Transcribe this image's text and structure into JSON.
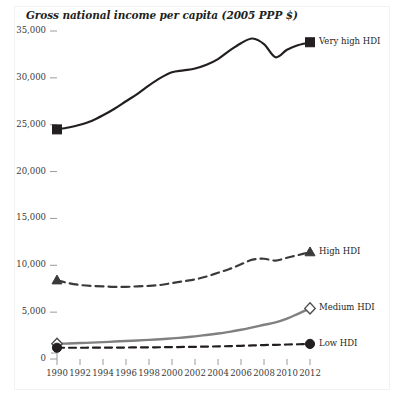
{
  "chart_data": {
    "type": "line",
    "title": "Gross national income per capita (2005 PPP $)",
    "xlabel": "",
    "ylabel": "",
    "grid": false,
    "legend_position": "right-inline",
    "xlim": [
      1990,
      2012
    ],
    "ylim": [
      0,
      35000
    ],
    "x": [
      1990,
      1991,
      1992,
      1993,
      1994,
      1995,
      1996,
      1997,
      1998,
      1999,
      2000,
      2001,
      2002,
      2003,
      2004,
      2005,
      2006,
      2007,
      2008,
      2009,
      2010,
      2011,
      2012
    ],
    "xticks": [
      "1990",
      "1992",
      "1994",
      "1996",
      "1998",
      "2000",
      "2002",
      "2004",
      "2006",
      "2008",
      "2010",
      "2012"
    ],
    "yticks": [
      "0",
      "5,000",
      "10,000",
      "15,000",
      "20,000",
      "25,000",
      "30,000",
      "35,000"
    ],
    "ytick_values": [
      0,
      5000,
      10000,
      15000,
      20000,
      25000,
      30000,
      35000
    ],
    "series": [
      {
        "name": "Very high HDI",
        "marker": "filled-square",
        "line_style": "solid",
        "color": "#231f20",
        "values": [
          24500,
          24700,
          25000,
          25400,
          26000,
          26700,
          27500,
          28300,
          29200,
          30000,
          30600,
          30800,
          31000,
          31400,
          32000,
          32900,
          33700,
          34200,
          33600,
          32200,
          33000,
          33500,
          33800
        ]
      },
      {
        "name": "High HDI",
        "marker": "filled-triangle",
        "line_style": "dashed",
        "color": "#3a3a3a",
        "values": [
          8400,
          8100,
          7900,
          7800,
          7750,
          7700,
          7700,
          7750,
          7800,
          7900,
          8100,
          8300,
          8500,
          8800,
          9200,
          9600,
          10100,
          10600,
          10700,
          10500,
          10800,
          11100,
          11400
        ]
      },
      {
        "name": "Medium HDI",
        "marker": "open-diamond",
        "line_style": "solid",
        "color": "#808080",
        "values": [
          1620,
          1660,
          1700,
          1750,
          1800,
          1860,
          1920,
          1980,
          2040,
          2110,
          2200,
          2300,
          2420,
          2560,
          2720,
          2900,
          3120,
          3380,
          3650,
          3900,
          4300,
          4850,
          5400
        ]
      },
      {
        "name": "Low HDI",
        "marker": "filled-circle",
        "line_style": "dashed",
        "color": "#231f20",
        "values": [
          1200,
          1200,
          1200,
          1205,
          1210,
          1215,
          1225,
          1235,
          1245,
          1255,
          1270,
          1285,
          1300,
          1320,
          1345,
          1375,
          1410,
          1450,
          1490,
          1510,
          1545,
          1575,
          1610
        ]
      }
    ]
  },
  "legend": [
    {
      "label": "Very high HDI"
    },
    {
      "label": "High HDI"
    },
    {
      "label": "Medium HDI"
    },
    {
      "label": "Low HDI"
    }
  ]
}
